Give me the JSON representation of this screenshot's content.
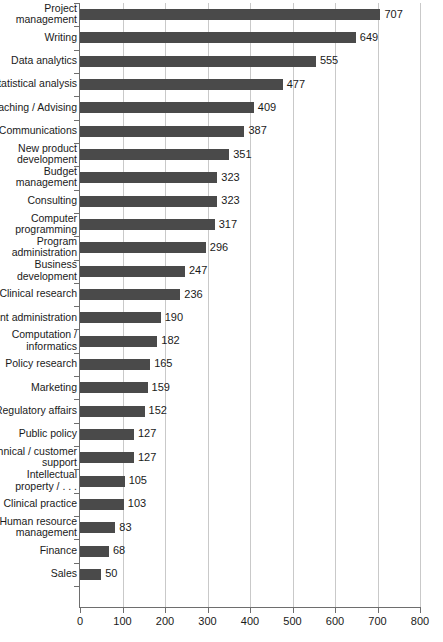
{
  "chart_data": {
    "type": "bar",
    "orientation": "horizontal",
    "title": "",
    "subtitle": "",
    "xlabel": "",
    "ylabel": "",
    "xlim": [
      0,
      800
    ],
    "xticks": [
      0,
      100,
      200,
      300,
      400,
      500,
      600,
      700,
      800
    ],
    "xtick_labels": [
      "0",
      "100",
      "200",
      "300",
      "400",
      "500",
      "600",
      "700",
      "800"
    ],
    "grid": "vertical",
    "legend": "none",
    "bar_color": "#4a4a4a",
    "gridline_color": "#c9c9c9",
    "axis_color": "#6e6e6e",
    "categories": [
      "Project\nmanagement",
      "Writing",
      "Data analytics",
      "Statistical analysis",
      "oaching / Advising",
      "Communications",
      "New product\ndevelopment",
      "Budget\nmanagement",
      "Consulting",
      "Computer\nprogramming",
      "Program\nadministration",
      "Business\ndevelopment",
      "Clinical research",
      "rant administration",
      "Computation /\ninformatics",
      "Policy research",
      "Marketing",
      "Regulatory affairs",
      "Public policy",
      "echnical / customer\nsupport",
      "Intellectual\nproperty / . . .",
      "Clinical practice",
      "Human resource\nmanagement",
      "Finance",
      "Sales"
    ],
    "values": [
      707,
      649,
      555,
      477,
      409,
      387,
      351,
      323,
      323,
      317,
      296,
      247,
      236,
      190,
      182,
      165,
      159,
      152,
      127,
      127,
      105,
      103,
      83,
      68,
      50
    ],
    "value_labels": [
      "707",
      "649",
      "555",
      "477",
      "409",
      "387",
      "351",
      "323",
      "323",
      "317",
      "296",
      "247",
      "236",
      "190",
      "182",
      "165",
      "159",
      "152",
      "127",
      "127",
      "105",
      "103",
      "83",
      "68",
      "50"
    ]
  }
}
